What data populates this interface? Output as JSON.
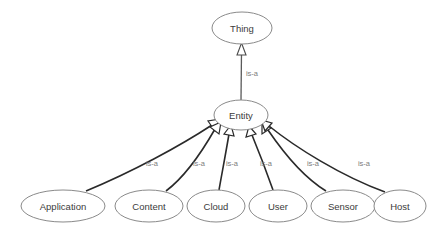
{
  "diagram": {
    "type": "class-hierarchy-graph",
    "title": "",
    "background_color": "#ffffff",
    "node_fill_color": "#ffffff",
    "node_stroke_color": "#8a8a8a",
    "node_text_color": "#3b3b3b",
    "edge_color": "#2a2a2a",
    "edge_label_color": "#7d7d7d",
    "arrowhead_style": "hollow-triangle",
    "nodes": [
      {
        "id": "thing",
        "label": "Thing",
        "cx": 242,
        "cy": 28,
        "rx": 30,
        "ry": 16
      },
      {
        "id": "entity",
        "label": "Entity",
        "cx": 241,
        "cy": 115,
        "rx": 27,
        "ry": 15
      },
      {
        "id": "application",
        "label": "Application",
        "cx": 63,
        "cy": 206,
        "rx": 42,
        "ry": 16
      },
      {
        "id": "content",
        "label": "Content",
        "cx": 149,
        "cy": 206,
        "rx": 34,
        "ry": 16
      },
      {
        "id": "cloud",
        "label": "Cloud",
        "cx": 216,
        "cy": 206,
        "rx": 29,
        "ry": 16
      },
      {
        "id": "user",
        "label": "User",
        "cx": 278,
        "cy": 206,
        "rx": 29,
        "ry": 16
      },
      {
        "id": "sensor",
        "label": "Sensor",
        "cx": 343,
        "cy": 206,
        "rx": 32,
        "ry": 16
      },
      {
        "id": "host",
        "label": "Host",
        "cx": 400,
        "cy": 206,
        "rx": 26,
        "ry": 16
      }
    ],
    "edges": [
      {
        "id": "e-entity-thing",
        "from": "entity",
        "to": "thing",
        "label": "is-a",
        "label_x": 252,
        "label_y": 74
      },
      {
        "id": "e-application-entity",
        "from": "application",
        "to": "entity",
        "label": "is-a",
        "label_x": 152,
        "label_y": 164
      },
      {
        "id": "e-content-entity",
        "from": "content",
        "to": "entity",
        "label": "is-a",
        "label_x": 199,
        "label_y": 164
      },
      {
        "id": "e-cloud-entity",
        "from": "cloud",
        "to": "entity",
        "label": "is-a",
        "label_x": 232,
        "label_y": 164
      },
      {
        "id": "e-user-entity",
        "from": "user",
        "to": "entity",
        "label": "is-a",
        "label_x": 266,
        "label_y": 164
      },
      {
        "id": "e-sensor-entity",
        "from": "sensor",
        "to": "entity",
        "label": "is-a",
        "label_x": 313,
        "label_y": 164
      },
      {
        "id": "e-host-entity",
        "from": "host",
        "to": "entity",
        "label": "is-a",
        "label_x": 364,
        "label_y": 164
      }
    ]
  }
}
